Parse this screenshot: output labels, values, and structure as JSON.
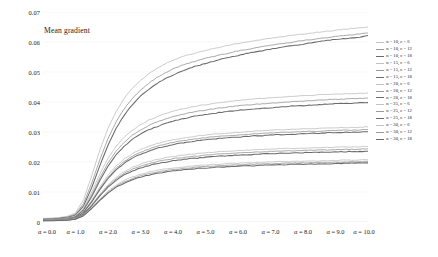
{
  "chart_data": {
    "type": "line",
    "title": "Mean gradient",
    "xlabel": "",
    "ylabel": "",
    "xlim": [
      0,
      10
    ],
    "ylim": [
      0,
      0.07
    ],
    "grid": false,
    "legend_position": "right",
    "x_tick_labels": [
      "α = 0.0",
      "α = 1.0",
      "α = 2.0",
      "α = 3.0",
      "α = 4.0",
      "α = 5.0",
      "α = 6.0",
      "α = 7.0",
      "α = 8.0",
      "α = 9.0",
      "α = 10.0"
    ],
    "x_tick_values": [
      0,
      1,
      2,
      3,
      4,
      5,
      6,
      7,
      8,
      9,
      10
    ],
    "y_tick_labels": [
      "0",
      "0.01",
      "0.02",
      "0.03",
      "0.04",
      "0.05",
      "0.06",
      "0.07"
    ],
    "y_tick_values": [
      0,
      0.01,
      0.02,
      0.03,
      0.04,
      0.05,
      0.06,
      0.07
    ],
    "x": [
      0,
      0.25,
      0.5,
      0.75,
      1,
      1.25,
      1.5,
      1.75,
      2,
      2.25,
      2.5,
      2.75,
      3,
      3.25,
      3.5,
      3.75,
      4,
      4.25,
      4.5,
      4.75,
      5,
      5.25,
      5.5,
      5.75,
      6,
      6.25,
      6.5,
      6.75,
      7,
      7.25,
      7.5,
      7.75,
      8,
      8.25,
      8.5,
      8.75,
      9,
      9.25,
      9.5,
      9.75,
      10
    ],
    "series": [
      {
        "name": "n = 10, c = 6",
        "n": 10,
        "c": 6,
        "color": "#c2c2c2",
        "width": 0.85,
        "values": [
          0.0012,
          0.0013,
          0.0015,
          0.0019,
          0.003,
          0.0075,
          0.0155,
          0.024,
          0.0312,
          0.0368,
          0.0412,
          0.0446,
          0.0472,
          0.0494,
          0.0512,
          0.0527,
          0.054,
          0.055,
          0.0558,
          0.0565,
          0.0572,
          0.0578,
          0.0584,
          0.059,
          0.0595,
          0.06,
          0.0604,
          0.0608,
          0.0612,
          0.0616,
          0.062,
          0.0623,
          0.0626,
          0.063,
          0.0633,
          0.0636,
          0.0639,
          0.0642,
          0.0645,
          0.0647,
          0.065
        ]
      },
      {
        "name": "n = 10, c = 12",
        "n": 10,
        "c": 12,
        "color": "#9a9a9a",
        "width": 0.85,
        "values": [
          0.001,
          0.0011,
          0.0013,
          0.0017,
          0.0026,
          0.0062,
          0.013,
          0.0208,
          0.0278,
          0.0334,
          0.0378,
          0.0412,
          0.044,
          0.0462,
          0.0481,
          0.0497,
          0.051,
          0.0521,
          0.053,
          0.0538,
          0.0546,
          0.0552,
          0.0558,
          0.0564,
          0.057,
          0.0575,
          0.058,
          0.0585,
          0.0589,
          0.0593,
          0.0597,
          0.0601,
          0.0605,
          0.0608,
          0.0612,
          0.0615,
          0.0618,
          0.0621,
          0.0624,
          0.0627,
          0.063
        ]
      },
      {
        "name": "n = 10, c = 18",
        "n": 10,
        "c": 18,
        "color": "#6b6b6b",
        "width": 1.05,
        "values": [
          0.0009,
          0.001,
          0.0012,
          0.0015,
          0.0023,
          0.0054,
          0.0115,
          0.0188,
          0.0256,
          0.0312,
          0.0356,
          0.0391,
          0.0419,
          0.0442,
          0.0461,
          0.0477,
          0.049,
          0.0502,
          0.0512,
          0.0521,
          0.0529,
          0.0536,
          0.0543,
          0.0549,
          0.0555,
          0.0561,
          0.0566,
          0.0571,
          0.0576,
          0.0581,
          0.0585,
          0.0589,
          0.0593,
          0.0597,
          0.0601,
          0.0605,
          0.0608,
          0.0611,
          0.0614,
          0.0616,
          0.0622
        ]
      },
      {
        "name": "n = 15, c = 6",
        "n": 15,
        "c": 6,
        "color": "#c2c2c2",
        "width": 0.85,
        "values": [
          0.0008,
          0.0009,
          0.001,
          0.0013,
          0.002,
          0.0048,
          0.01,
          0.016,
          0.0212,
          0.0252,
          0.0283,
          0.0306,
          0.0324,
          0.0339,
          0.0351,
          0.0361,
          0.0369,
          0.0376,
          0.0382,
          0.0387,
          0.0391,
          0.0395,
          0.0399,
          0.0402,
          0.0405,
          0.0408,
          0.041,
          0.0412,
          0.0414,
          0.0416,
          0.0418,
          0.0419,
          0.0421,
          0.0422,
          0.0424,
          0.0425,
          0.0426,
          0.0427,
          0.0428,
          0.0429,
          0.043
        ]
      },
      {
        "name": "n = 15, c = 12",
        "n": 15,
        "c": 12,
        "color": "#9a9a9a",
        "width": 0.85,
        "values": [
          0.0007,
          0.0008,
          0.0009,
          0.0012,
          0.0018,
          0.0043,
          0.0091,
          0.0147,
          0.0197,
          0.0236,
          0.0266,
          0.0289,
          0.0307,
          0.0321,
          0.0333,
          0.0343,
          0.0351,
          0.0358,
          0.0364,
          0.0369,
          0.0373,
          0.0377,
          0.0381,
          0.0384,
          0.0387,
          0.039,
          0.0392,
          0.0394,
          0.0396,
          0.0398,
          0.04,
          0.0402,
          0.0403,
          0.0405,
          0.0406,
          0.0408,
          0.0409,
          0.041,
          0.0411,
          0.0412,
          0.0413
        ]
      },
      {
        "name": "n = 15, c = 18",
        "n": 15,
        "c": 18,
        "color": "#6b6b6b",
        "width": 1.05,
        "values": [
          0.0007,
          0.0008,
          0.0009,
          0.0011,
          0.0017,
          0.004,
          0.0085,
          0.0138,
          0.0186,
          0.0224,
          0.0253,
          0.0276,
          0.0293,
          0.0307,
          0.0318,
          0.0328,
          0.0336,
          0.0343,
          0.0349,
          0.0354,
          0.0358,
          0.0362,
          0.0366,
          0.0369,
          0.0372,
          0.0375,
          0.0377,
          0.0379,
          0.0381,
          0.0383,
          0.0385,
          0.0387,
          0.0388,
          0.039,
          0.0391,
          0.0393,
          0.0394,
          0.0395,
          0.0396,
          0.0397,
          0.0398
        ]
      },
      {
        "name": "n = 20, c = 6",
        "n": 20,
        "c": 6,
        "color": "#c2c2c2",
        "width": 0.85,
        "values": [
          0.0006,
          0.0007,
          0.0008,
          0.001,
          0.0015,
          0.0035,
          0.0073,
          0.0117,
          0.0156,
          0.0187,
          0.021,
          0.0228,
          0.0241,
          0.0252,
          0.0261,
          0.0268,
          0.0274,
          0.0279,
          0.0283,
          0.0287,
          0.029,
          0.0293,
          0.0295,
          0.0297,
          0.0299,
          0.0301,
          0.0303,
          0.0304,
          0.0306,
          0.0307,
          0.0308,
          0.0309,
          0.031,
          0.0311,
          0.0312,
          0.0313,
          0.0314,
          0.0315,
          0.0315,
          0.0316,
          0.0317
        ]
      },
      {
        "name": "n = 20, c = 12",
        "n": 20,
        "c": 12,
        "color": "#9a9a9a",
        "width": 0.85,
        "values": [
          0.0006,
          0.0007,
          0.0008,
          0.001,
          0.0014,
          0.0033,
          0.0069,
          0.0111,
          0.0149,
          0.0179,
          0.0202,
          0.0219,
          0.0232,
          0.0243,
          0.0252,
          0.0259,
          0.0265,
          0.027,
          0.0274,
          0.0278,
          0.0281,
          0.0284,
          0.0286,
          0.0288,
          0.029,
          0.0292,
          0.0294,
          0.0295,
          0.0297,
          0.0298,
          0.0299,
          0.03,
          0.0301,
          0.0302,
          0.0303,
          0.0304,
          0.0305,
          0.0306,
          0.0306,
          0.0307,
          0.0308
        ]
      },
      {
        "name": "n = 20, c = 18",
        "n": 20,
        "c": 18,
        "color": "#6b6b6b",
        "width": 1.05,
        "values": [
          0.0006,
          0.0006,
          0.0007,
          0.0009,
          0.0014,
          0.0032,
          0.0067,
          0.0108,
          0.0145,
          0.0174,
          0.0196,
          0.0213,
          0.0226,
          0.0236,
          0.0245,
          0.0252,
          0.0258,
          0.0263,
          0.0267,
          0.0271,
          0.0274,
          0.0277,
          0.0279,
          0.0281,
          0.0283,
          0.0285,
          0.0287,
          0.0288,
          0.029,
          0.0291,
          0.0292,
          0.0293,
          0.0294,
          0.0295,
          0.0296,
          0.0297,
          0.0298,
          0.0299,
          0.0299,
          0.03,
          0.0301
        ]
      },
      {
        "name": "n = 25, c = 6",
        "n": 25,
        "c": 6,
        "color": "#c2c2c2",
        "width": 0.85,
        "values": [
          0.0005,
          0.0006,
          0.0007,
          0.0008,
          0.0012,
          0.0028,
          0.0058,
          0.0093,
          0.0124,
          0.0149,
          0.0168,
          0.0182,
          0.0193,
          0.0201,
          0.0208,
          0.0214,
          0.0218,
          0.0222,
          0.0225,
          0.0228,
          0.0231,
          0.0233,
          0.0235,
          0.0236,
          0.0238,
          0.0239,
          0.024,
          0.0242,
          0.0243,
          0.0244,
          0.0245,
          0.0245,
          0.0246,
          0.0247,
          0.0248,
          0.0248,
          0.0249,
          0.025,
          0.025,
          0.0251,
          0.0252
        ]
      },
      {
        "name": "n = 25, c = 12",
        "n": 25,
        "c": 12,
        "color": "#9a9a9a",
        "width": 0.85,
        "values": [
          0.0005,
          0.0006,
          0.0006,
          0.0008,
          0.0012,
          0.0027,
          0.0056,
          0.009,
          0.012,
          0.0144,
          0.0162,
          0.0176,
          0.0186,
          0.0194,
          0.0201,
          0.0206,
          0.0211,
          0.0214,
          0.0218,
          0.022,
          0.0223,
          0.0225,
          0.0227,
          0.0228,
          0.023,
          0.0231,
          0.0233,
          0.0234,
          0.0235,
          0.0236,
          0.0237,
          0.0237,
          0.0238,
          0.0239,
          0.024,
          0.024,
          0.0241,
          0.0242,
          0.0242,
          0.0243,
          0.0244
        ]
      },
      {
        "name": "n = 25, c = 18",
        "n": 25,
        "c": 18,
        "color": "#6b6b6b",
        "width": 1.05,
        "values": [
          0.0005,
          0.0005,
          0.0006,
          0.0008,
          0.0011,
          0.0026,
          0.0054,
          0.0087,
          0.0116,
          0.0139,
          0.0157,
          0.017,
          0.018,
          0.0188,
          0.0194,
          0.0199,
          0.0204,
          0.0207,
          0.0211,
          0.0213,
          0.0216,
          0.0218,
          0.022,
          0.0221,
          0.0223,
          0.0224,
          0.0225,
          0.0227,
          0.0228,
          0.0229,
          0.0229,
          0.023,
          0.0231,
          0.0232,
          0.0232,
          0.0233,
          0.0234,
          0.0234,
          0.0235,
          0.0235,
          0.0236
        ]
      },
      {
        "name": "n = 30, c = 6",
        "n": 30,
        "c": 6,
        "color": "#c2c2c2",
        "width": 0.85,
        "values": [
          0.0004,
          0.0005,
          0.0005,
          0.0007,
          0.001,
          0.0023,
          0.0048,
          0.0077,
          0.0103,
          0.0123,
          0.0139,
          0.015,
          0.0159,
          0.0166,
          0.0172,
          0.0176,
          0.018,
          0.0183,
          0.0186,
          0.0188,
          0.019,
          0.0192,
          0.0193,
          0.0195,
          0.0196,
          0.0197,
          0.0198,
          0.0199,
          0.02,
          0.0201,
          0.0201,
          0.0202,
          0.0203,
          0.0203,
          0.0204,
          0.0204,
          0.0205,
          0.0206,
          0.0206,
          0.0207,
          0.0207
        ]
      },
      {
        "name": "n = 30, c = 12",
        "n": 30,
        "c": 12,
        "color": "#9a9a9a",
        "width": 0.85,
        "values": [
          0.0004,
          0.0005,
          0.0005,
          0.0006,
          0.001,
          0.0022,
          0.0046,
          0.0074,
          0.0099,
          0.0119,
          0.0134,
          0.0145,
          0.0154,
          0.0161,
          0.0166,
          0.0171,
          0.0174,
          0.0178,
          0.018,
          0.0183,
          0.0185,
          0.0186,
          0.0188,
          0.0189,
          0.019,
          0.0192,
          0.0193,
          0.0194,
          0.0194,
          0.0195,
          0.0196,
          0.0197,
          0.0197,
          0.0198,
          0.0198,
          0.0199,
          0.02,
          0.02,
          0.0201,
          0.0201,
          0.0202
        ]
      },
      {
        "name": "n = 30, c = 18",
        "n": 30,
        "c": 18,
        "color": "#6b6b6b",
        "width": 1.05,
        "values": [
          0.0004,
          0.0004,
          0.0005,
          0.0006,
          0.0009,
          0.0021,
          0.0045,
          0.0072,
          0.0096,
          0.0116,
          0.013,
          0.0141,
          0.015,
          0.0156,
          0.0162,
          0.0166,
          0.017,
          0.0173,
          0.0176,
          0.0178,
          0.018,
          0.0182,
          0.0183,
          0.0185,
          0.0186,
          0.0187,
          0.0188,
          0.0189,
          0.019,
          0.0191,
          0.0191,
          0.0192,
          0.0193,
          0.0193,
          0.0194,
          0.0194,
          0.0195,
          0.0196,
          0.0196,
          0.0197,
          0.0197
        ]
      }
    ]
  }
}
